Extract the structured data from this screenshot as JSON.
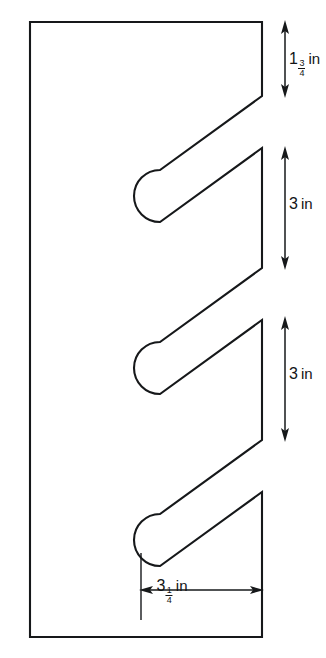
{
  "figure": {
    "type": "engineering-dimension-drawing",
    "stroke_color": "#16181a",
    "background_color": "#ffffff",
    "units": "in",
    "plate": {
      "shape": "rectangle-with-three-slanted-slots",
      "left_edge_x": 30,
      "right_edge_x": 262,
      "top_edge_y": 22,
      "bottom_edge_y": 637
    },
    "dimensions": [
      {
        "id": "top-right-segment",
        "orientation": "vertical",
        "whole": "1",
        "numerator": "3",
        "denominator": "4",
        "unit": "in",
        "value_text": "1 3/4 in",
        "decimal_value": 1.75,
        "arrow_top_y": 22,
        "arrow_bottom_y": 96
      },
      {
        "id": "upper-slot-pitch",
        "orientation": "vertical",
        "whole": "3",
        "numerator": "",
        "denominator": "",
        "unit": "in",
        "value_text": "3 in",
        "decimal_value": 3,
        "arrow_top_y": 148,
        "arrow_bottom_y": 268
      },
      {
        "id": "lower-slot-pitch",
        "orientation": "vertical",
        "whole": "3",
        "numerator": "",
        "denominator": "",
        "unit": "in",
        "value_text": "3 in",
        "decimal_value": 3,
        "arrow_top_y": 318,
        "arrow_bottom_y": 440
      },
      {
        "id": "slot-depth",
        "orientation": "horizontal",
        "whole": "3",
        "numerator": "1",
        "denominator": "4",
        "unit": "in",
        "value_text": "3 1/4 in",
        "decimal_value": 3.25,
        "arrow_left_x": 141,
        "arrow_right_x": 262
      }
    ]
  }
}
